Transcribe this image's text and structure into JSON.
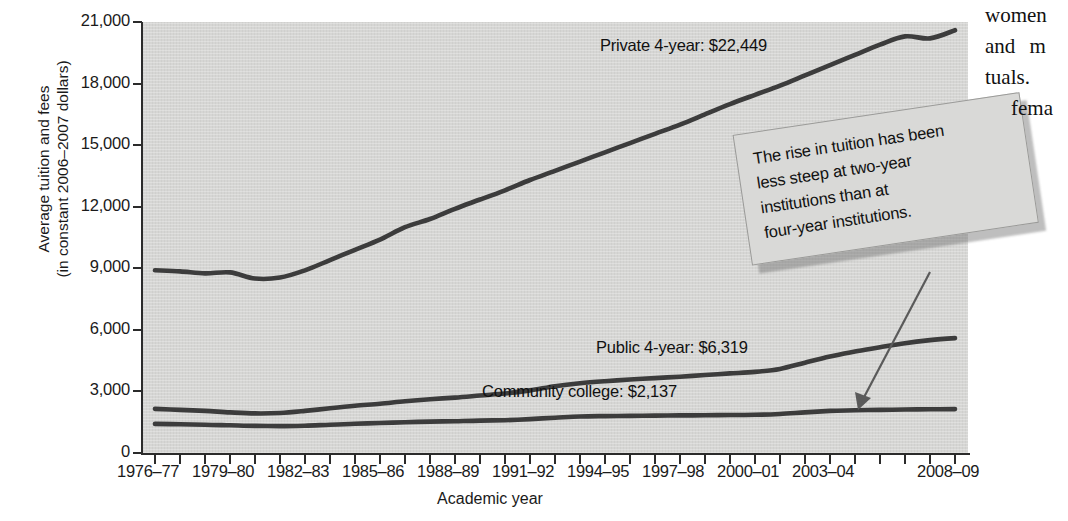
{
  "chart_data": {
    "type": "line",
    "title": "",
    "xlabel": "Academic year",
    "ylabel": "Average tuition and fees\n(in constant 2006–2007 dollars)",
    "ylabel_line1": "Average tuition and fees",
    "ylabel_line2": "(in constant 2006–2007 dollars)",
    "ylim": [
      0,
      21000
    ],
    "ytick_labels": [
      "21,000",
      "18,000",
      "15,000",
      "12,000",
      "9,000",
      "6,000",
      "3,000",
      "0"
    ],
    "ytick_values": [
      21000,
      18000,
      15000,
      12000,
      9000,
      6000,
      3000,
      0
    ],
    "xtick_labels": [
      "1976–77",
      "1979–80",
      "1982–83",
      "1985–86",
      "1988–89",
      "1991–92",
      "1994–95",
      "1997–98",
      "2000–01",
      "2003–04",
      "2008–09"
    ],
    "categories": [
      "1976–77",
      "1977–78",
      "1978–79",
      "1979–80",
      "1980–81",
      "1981–82",
      "1982–83",
      "1983–84",
      "1984–85",
      "1985–86",
      "1986–87",
      "1987–88",
      "1988–89",
      "1989–90",
      "1990–91",
      "1991–92",
      "1992–93",
      "1993–94",
      "1994–95",
      "1995–96",
      "1996–97",
      "1997–98",
      "1998–99",
      "1999–00",
      "2000–01",
      "2001–02",
      "2002–03",
      "2003–04",
      "2004–05",
      "2005–06",
      "2006–07",
      "2007–08",
      "2008–09"
    ],
    "grid": false,
    "legend_position": "inline-labels",
    "series": [
      {
        "name": "Private 4-year",
        "end_label": "Private 4-year: $22,449",
        "end_value": 22449,
        "color": "#3c3c3c",
        "values": [
          8900,
          8850,
          8750,
          8800,
          8500,
          8550,
          8900,
          9400,
          9900,
          10400,
          11000,
          11400,
          11900,
          12350,
          12800,
          13300,
          13750,
          14200,
          14650,
          15100,
          15550,
          16000,
          16500,
          17000,
          17450,
          17900,
          18400,
          18900,
          19400,
          19900,
          20300,
          20200,
          20600
        ]
      },
      {
        "name": "Public 4-year",
        "end_label": "Public 4-year: $6,319",
        "end_value": 6319,
        "color": "#3c3c3c",
        "values": [
          2150,
          2100,
          2050,
          1980,
          1930,
          1950,
          2050,
          2180,
          2300,
          2400,
          2520,
          2620,
          2700,
          2800,
          2900,
          3050,
          3250,
          3400,
          3500,
          3580,
          3650,
          3720,
          3800,
          3880,
          3950,
          4100,
          4400,
          4700,
          4950,
          5150,
          5350,
          5500,
          5600
        ]
      },
      {
        "name": "Community college",
        "end_label": "Community college: $2,137",
        "end_value": 2137,
        "color": "#3c3c3c",
        "values": [
          1420,
          1400,
          1380,
          1350,
          1320,
          1310,
          1330,
          1380,
          1430,
          1460,
          1500,
          1530,
          1550,
          1580,
          1600,
          1650,
          1720,
          1780,
          1800,
          1810,
          1820,
          1830,
          1840,
          1850,
          1860,
          1900,
          1980,
          2050,
          2080,
          2100,
          2120,
          2130,
          2137
        ]
      }
    ]
  },
  "callout": {
    "text": "The rise in tuition has been less steep at two-year institutions than at four-year institutions.",
    "line1": "The rise in tuition has been",
    "line2": "less steep at two-year",
    "line3": "institutions than at",
    "line4": "four-year institutions.",
    "box_color": "#d9d9d7",
    "arrow_color": "#5a5a5a"
  },
  "page_text": {
    "line1": "women",
    "line2": "and  m",
    "line3": "tuals.",
    "line4": "fema"
  },
  "colors": {
    "plot_background": "#d6d6d4",
    "line": "#3c3c3c",
    "axis": "#2b2b2b",
    "text": "#1a1a1a"
  }
}
